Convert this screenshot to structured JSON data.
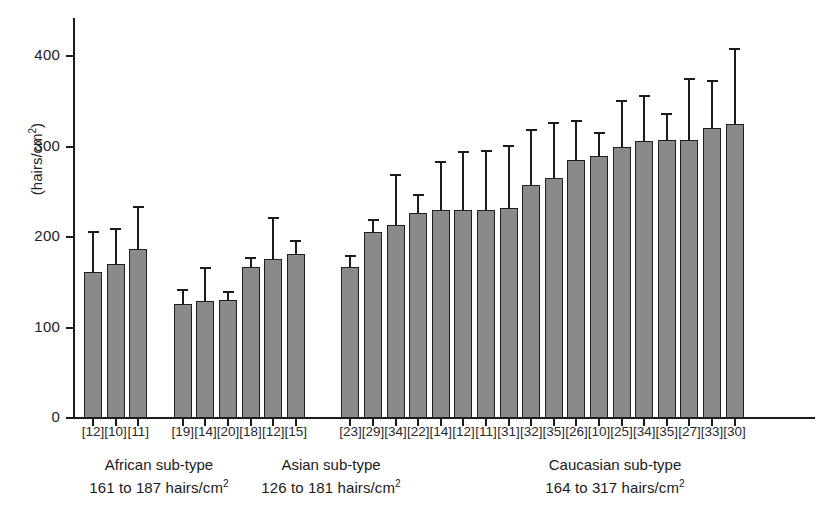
{
  "chart_data": {
    "type": "bar",
    "title": "",
    "subtitle": "",
    "xlabel": "",
    "ylabel": "(hairs/cm2)",
    "ylabel_base": "(hairs/cm",
    "ylabel_sup": "2",
    "ylabel_tail": ")",
    "ylim": [
      0,
      440
    ],
    "yticks": [
      0,
      100,
      200,
      300,
      400
    ],
    "ytick_labels": [
      "0",
      "100",
      "200",
      "300",
      "400"
    ],
    "grid": false,
    "legend": "none",
    "error_bars": "upper-only (SD)",
    "categories": [
      "[12]",
      "[10]",
      "[11]",
      "[19]",
      "[14]",
      "[20]",
      "[18]",
      "[12]",
      "[15]",
      "[23]",
      "[29]",
      "[34]",
      "[22]",
      "[14]",
      "[12]",
      "[11]",
      "[31]",
      "[32]",
      "[35]",
      "[26]",
      "[10]",
      "[25]",
      "[34]",
      "[35]",
      "[27]",
      "[33]",
      "[30]"
    ],
    "values": [
      161,
      170,
      187,
      126,
      129,
      130,
      167,
      176,
      181,
      167,
      206,
      213,
      226,
      230,
      230,
      230,
      232,
      257,
      265,
      285,
      289,
      299,
      306,
      307,
      307,
      320,
      325
    ],
    "errors_upper": [
      46,
      40,
      47,
      17,
      38,
      10,
      11,
      46,
      16,
      13,
      14,
      57,
      21,
      54,
      65,
      66,
      70,
      62,
      62,
      44,
      27,
      52,
      51,
      30,
      69,
      54,
      84
    ],
    "series": [
      {
        "name": "Mean hair density",
        "values": [
          161,
          170,
          187,
          126,
          129,
          130,
          167,
          176,
          181,
          167,
          206,
          213,
          226,
          230,
          230,
          230,
          232,
          257,
          265,
          285,
          289,
          299,
          306,
          307,
          307,
          320,
          325
        ]
      }
    ],
    "groups": [
      {
        "id": "african",
        "name": "African sub-type",
        "range": "161 to 187 hairs/cm",
        "range_sup": "2",
        "start_index": 0,
        "end_index": 2
      },
      {
        "id": "asian",
        "name": "Asian sub-type",
        "range": "126 to 181 hairs/cm",
        "range_sup": "2",
        "start_index": 3,
        "end_index": 8
      },
      {
        "id": "caucasian",
        "name": "Caucasian sub-type",
        "range": "164 to 317 hairs/cm",
        "range_sup": "2",
        "start_index": 9,
        "end_index": 26
      }
    ],
    "colors": {
      "bar_fill": "#8a8a8a",
      "bar_stroke": "#1f1f1f",
      "axis": "#1c1c1c",
      "text": "#1a1a1a",
      "background": "#ffffff"
    }
  },
  "groups_text": {
    "african": {
      "line1": "African sub-type",
      "line2": "161 to 187 hairs/cm",
      "sup": "2"
    },
    "asian": {
      "line1": "Asian sub-type",
      "line2": "126 to 181 hairs/cm",
      "sup": "2"
    },
    "caucasian": {
      "line1": "Caucasian sub-type",
      "line2": "164 to 317 hairs/cm",
      "sup": "2"
    }
  }
}
